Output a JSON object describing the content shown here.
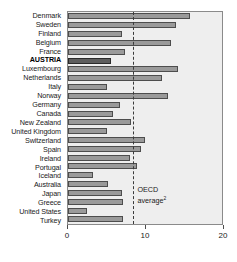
{
  "chart_data": {
    "type": "bar",
    "orientation": "horizontal",
    "title": "",
    "xlabel": "",
    "ylabel": "",
    "xlim": [
      0,
      20
    ],
    "xticks": [
      0,
      10,
      20
    ],
    "xticklabels": [
      "0",
      "10",
      "20"
    ],
    "grid": false,
    "legend": false,
    "highlight_category": "AUSTRIA",
    "annotations": [
      {
        "name": "oecd-average-line",
        "type": "vline",
        "value": 8.5,
        "style": "dashed",
        "label_line1": "OECD",
        "label_line2": "average",
        "label_superscript": "2"
      }
    ],
    "categories": [
      "Denmark",
      "Sweden",
      "Finland",
      "Belgium",
      "France",
      "AUSTRIA",
      "Luxembourg",
      "Netherlands",
      "Italy",
      "Norway",
      "Germany",
      "Canada",
      "New Zealand",
      "United Kingdom",
      "Switzerland",
      "Spain",
      "Ireland",
      "Portugal",
      "Iceland",
      "Australia",
      "Japan",
      "Greece",
      "United States",
      "Turkey"
    ],
    "values": [
      15.8,
      14.0,
      7.0,
      13.4,
      7.4,
      5.6,
      14.3,
      12.2,
      5.0,
      13.0,
      6.7,
      5.8,
      8.2,
      5.0,
      10.0,
      9.5,
      8.0,
      9.0,
      3.2,
      5.2,
      7.0,
      7.2,
      2.5,
      7.2
    ]
  },
  "colors": {
    "bar_fill": "#9a9a9a",
    "bar_border": "#4d4d4d",
    "highlight_fill": "#5e5e5e",
    "highlight_border": "#2b2b2b",
    "plot_background": "#eeeeee",
    "plot_border": "#8a8a8a",
    "text": "#1a1a1a"
  }
}
